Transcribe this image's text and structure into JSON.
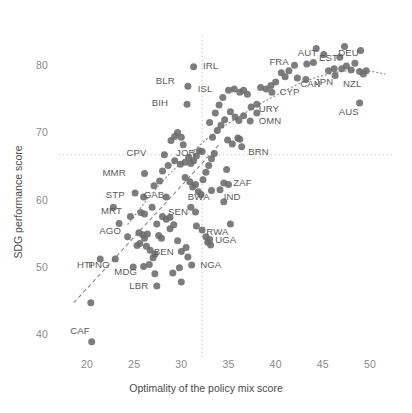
{
  "chart_data": {
    "type": "scatter",
    "title": "",
    "xlabel": "Optimality of the policy mix score",
    "ylabel": "SDG performance score",
    "xlim": [
      17.0,
      52.5
    ],
    "ylim": [
      36.5,
      84.5
    ],
    "xticks": [
      20,
      25,
      30,
      35,
      40,
      45,
      50
    ],
    "yticks": [
      40,
      50,
      60,
      70,
      80
    ],
    "grid": false,
    "legend": "none",
    "reference_lines": [
      {
        "orient": "vertical",
        "value": 32.2,
        "style": "dotted",
        "color": "#c9c9c9"
      },
      {
        "orient": "horizontal",
        "value": 66.8,
        "style": "dotted",
        "color": "#c9c9c9"
      }
    ],
    "fit_lines": [
      {
        "name": "linear-trend",
        "style": "dashed",
        "color": "#8a8a8a",
        "x": [
          18.6,
          34.2
        ],
        "y": [
          44.8,
          68.6
        ]
      },
      {
        "name": "loess-curve",
        "style": "dotted",
        "color": "#8a8a8a",
        "points": [
          [
            24.3,
            56.4
          ],
          [
            26.5,
            60.4
          ],
          [
            28.5,
            63.6
          ],
          [
            30.5,
            66.4
          ],
          [
            32.4,
            68.8
          ],
          [
            34.5,
            71.0
          ],
          [
            36.5,
            72.8
          ],
          [
            38.5,
            74.5
          ],
          [
            40.5,
            76.0
          ],
          [
            42.5,
            77.4
          ],
          [
            44.5,
            78.4
          ],
          [
            46.5,
            79.1
          ],
          [
            48.5,
            79.4
          ],
          [
            50.2,
            79.2
          ],
          [
            51.6,
            78.8
          ]
        ]
      }
    ],
    "marker": {
      "shape": "circle",
      "color": "#6b6b6b",
      "size": 7,
      "opacity": 0.88
    },
    "labeled_points": [
      {
        "label": "IRL",
        "x": 31.3,
        "y": 79.9,
        "lx": 32.3,
        "ly": 79.8
      },
      {
        "label": "BLR",
        "x": 30.7,
        "y": 77.0,
        "lx": 29.3,
        "ly": 77.6
      },
      {
        "label": "BIH",
        "x": 30.6,
        "y": 74.3,
        "lx": 28.6,
        "ly": 74.3
      },
      {
        "label": "ISL",
        "x": 35.0,
        "y": 76.4,
        "lx": 33.3,
        "ly": 76.4
      },
      {
        "label": "FRA",
        "x": 43.3,
        "y": 80.3,
        "lx": 41.4,
        "ly": 80.4
      },
      {
        "label": "AUT",
        "x": 45.1,
        "y": 81.7,
        "lx": 44.4,
        "ly": 81.8
      },
      {
        "label": "EST",
        "x": 46.8,
        "y": 81.3,
        "lx": 46.6,
        "ly": 81.1
      },
      {
        "label": "DEU",
        "x": 49.0,
        "y": 82.3,
        "lx": 48.8,
        "ly": 81.8
      },
      {
        "label": "JPN",
        "x": 46.3,
        "y": 78.6,
        "lx": 46.1,
        "ly": 77.4
      },
      {
        "label": "NZL",
        "x": 49.3,
        "y": 78.8,
        "lx": 49.1,
        "ly": 77.2
      },
      {
        "label": "CAN",
        "x": 42.3,
        "y": 78.2,
        "lx": 42.6,
        "ly": 77.2
      },
      {
        "label": "CYP",
        "x": 39.6,
        "y": 76.1,
        "lx": 40.4,
        "ly": 76.0
      },
      {
        "label": "AUS",
        "x": 48.9,
        "y": 74.5,
        "lx": 48.8,
        "ly": 73.0
      },
      {
        "label": "URY",
        "x": 38.0,
        "y": 74.3,
        "lx": 38.2,
        "ly": 73.5
      },
      {
        "label": "OMN",
        "x": 37.3,
        "y": 71.8,
        "lx": 38.2,
        "ly": 71.6
      },
      {
        "label": "BRN",
        "x": 36.2,
        "y": 69.1,
        "lx": 37.1,
        "ly": 67.0
      },
      {
        "label": "JOR",
        "x": 32.2,
        "y": 67.3,
        "lx": 31.5,
        "ly": 66.9
      },
      {
        "label": "CPV",
        "x": 28.2,
        "y": 66.8,
        "lx": 26.3,
        "ly": 66.9
      },
      {
        "label": "MMR",
        "x": 26.1,
        "y": 64.0,
        "lx": 24.1,
        "ly": 64.0
      },
      {
        "label": "STP",
        "x": 26.0,
        "y": 60.5,
        "lx": 24.0,
        "ly": 60.6
      },
      {
        "label": "GAB",
        "x": 28.4,
        "y": 60.5,
        "lx": 28.2,
        "ly": 60.7
      },
      {
        "label": "MRT",
        "x": 25.7,
        "y": 58.2,
        "lx": 23.7,
        "ly": 58.3
      },
      {
        "label": "AGO",
        "x": 25.5,
        "y": 55.2,
        "lx": 23.6,
        "ly": 55.3
      },
      {
        "label": "BWA",
        "x": 33.2,
        "y": 61.5,
        "lx": 33.0,
        "ly": 60.3
      },
      {
        "label": "IND",
        "x": 34.1,
        "y": 61.6,
        "lx": 34.5,
        "ly": 60.3
      },
      {
        "label": "ZAF",
        "x": 34.5,
        "y": 62.6,
        "lx": 35.5,
        "ly": 62.5
      },
      {
        "label": "SEN",
        "x": 31.5,
        "y": 58.3,
        "lx": 30.7,
        "ly": 58.2
      },
      {
        "label": "RWA",
        "x": 35.2,
        "y": 56.5,
        "lx": 35.0,
        "ly": 55.2
      },
      {
        "label": "UGA",
        "x": 33.0,
        "y": 54.2,
        "lx": 33.6,
        "ly": 54.0
      },
      {
        "label": "BEN",
        "x": 30.0,
        "y": 52.4,
        "lx": 29.2,
        "ly": 52.2
      },
      {
        "label": "NGA",
        "x": 31.1,
        "y": 50.4,
        "lx": 32.0,
        "ly": 50.3
      },
      {
        "label": "HTI",
        "x": 21.4,
        "y": 51.3,
        "lx": 20.6,
        "ly": 50.2
      },
      {
        "label": "PNG",
        "x": 23.0,
        "y": 51.3,
        "lx": 22.4,
        "ly": 50.2
      },
      {
        "label": "MDG",
        "x": 27.2,
        "y": 49.1,
        "lx": 25.3,
        "ly": 49.2
      },
      {
        "label": "LBR",
        "x": 27.4,
        "y": 47.3,
        "lx": 26.5,
        "ly": 47.2
      },
      {
        "label": "CAF",
        "x": 20.5,
        "y": 39.0,
        "lx": 20.3,
        "ly": 40.4
      }
    ],
    "unlabeled_points": [
      [
        22.8,
        59.0
      ],
      [
        23.4,
        56.6
      ],
      [
        24.3,
        54.6
      ],
      [
        24.6,
        57.6
      ],
      [
        20.4,
        44.8
      ],
      [
        25.3,
        53.3
      ],
      [
        25.6,
        53.6
      ],
      [
        25.9,
        54.9
      ],
      [
        26.1,
        54.4
      ],
      [
        26.3,
        53.2
      ],
      [
        26.4,
        55.0
      ],
      [
        26.7,
        52.6
      ],
      [
        26.0,
        50.2
      ],
      [
        26.6,
        50.5
      ],
      [
        27.0,
        51.5
      ],
      [
        27.2,
        52.0
      ],
      [
        24.9,
        50.1
      ],
      [
        25.1,
        61.1
      ],
      [
        26.1,
        58.0
      ],
      [
        26.9,
        59.0
      ],
      [
        27.4,
        56.5
      ],
      [
        27.6,
        54.8
      ],
      [
        27.9,
        54.4
      ],
      [
        28.0,
        57.6
      ],
      [
        28.4,
        57.2
      ],
      [
        28.8,
        57.5
      ],
      [
        27.1,
        62.2
      ],
      [
        27.7,
        62.9
      ],
      [
        28.0,
        64.4
      ],
      [
        28.6,
        65.2
      ],
      [
        28.9,
        68.9
      ],
      [
        29.3,
        69.5
      ],
      [
        29.6,
        70.1
      ],
      [
        30.0,
        69.4
      ],
      [
        30.2,
        68.3
      ],
      [
        29.3,
        65.9
      ],
      [
        29.9,
        65.4
      ],
      [
        30.4,
        65.7
      ],
      [
        30.8,
        66.4
      ],
      [
        31.0,
        65.5
      ],
      [
        31.3,
        65.9
      ],
      [
        31.6,
        66.6
      ],
      [
        31.9,
        67.4
      ],
      [
        30.4,
        63.4
      ],
      [
        30.9,
        62.8
      ],
      [
        31.2,
        62.0
      ],
      [
        31.5,
        62.4
      ],
      [
        31.8,
        61.3
      ],
      [
        32.1,
        60.9
      ],
      [
        32.3,
        63.1
      ],
      [
        32.6,
        64.2
      ],
      [
        32.9,
        65.2
      ],
      [
        33.2,
        66.2
      ],
      [
        33.5,
        67.0
      ],
      [
        31.0,
        59.0
      ],
      [
        31.6,
        56.2
      ],
      [
        32.2,
        55.6
      ],
      [
        32.6,
        54.6
      ],
      [
        32.8,
        53.8
      ],
      [
        33.1,
        53.4
      ],
      [
        30.5,
        53.0
      ],
      [
        30.7,
        51.6
      ],
      [
        29.8,
        50.0
      ],
      [
        29.1,
        49.2
      ],
      [
        30.0,
        47.9
      ],
      [
        28.8,
        55.8
      ],
      [
        29.2,
        56.4
      ],
      [
        29.6,
        54.0
      ],
      [
        33.3,
        69.4
      ],
      [
        33.8,
        70.4
      ],
      [
        34.2,
        71.2
      ],
      [
        34.6,
        72.0
      ],
      [
        33.0,
        71.6
      ],
      [
        33.6,
        73.0
      ],
      [
        34.0,
        74.2
      ],
      [
        34.4,
        75.3
      ],
      [
        35.6,
        76.6
      ],
      [
        36.2,
        76.1
      ],
      [
        36.6,
        76.4
      ],
      [
        37.0,
        75.8
      ],
      [
        35.2,
        73.2
      ],
      [
        35.7,
        72.4
      ],
      [
        36.1,
        71.9
      ],
      [
        36.6,
        72.6
      ],
      [
        37.4,
        73.9
      ],
      [
        38.0,
        73.0
      ],
      [
        38.4,
        76.8
      ],
      [
        39.0,
        76.6
      ],
      [
        39.5,
        77.1
      ],
      [
        40.0,
        77.6
      ],
      [
        40.6,
        79.0
      ],
      [
        41.0,
        78.4
      ],
      [
        41.4,
        79.3
      ],
      [
        42.0,
        80.1
      ],
      [
        43.2,
        78.0
      ],
      [
        44.0,
        80.5
      ],
      [
        44.3,
        82.6
      ],
      [
        45.6,
        79.3
      ],
      [
        46.2,
        79.6
      ],
      [
        47.0,
        79.6
      ],
      [
        47.5,
        80.0
      ],
      [
        48.0,
        79.4
      ],
      [
        48.4,
        80.4
      ],
      [
        48.9,
        79.2
      ],
      [
        49.6,
        79.3
      ],
      [
        47.3,
        82.9
      ],
      [
        34.9,
        69.0
      ],
      [
        35.4,
        68.4
      ],
      [
        36.0,
        69.3
      ],
      [
        36.4,
        68.0
      ],
      [
        34.8,
        64.6
      ],
      [
        35.0,
        62.4
      ],
      [
        34.5,
        59.8
      ]
    ]
  }
}
